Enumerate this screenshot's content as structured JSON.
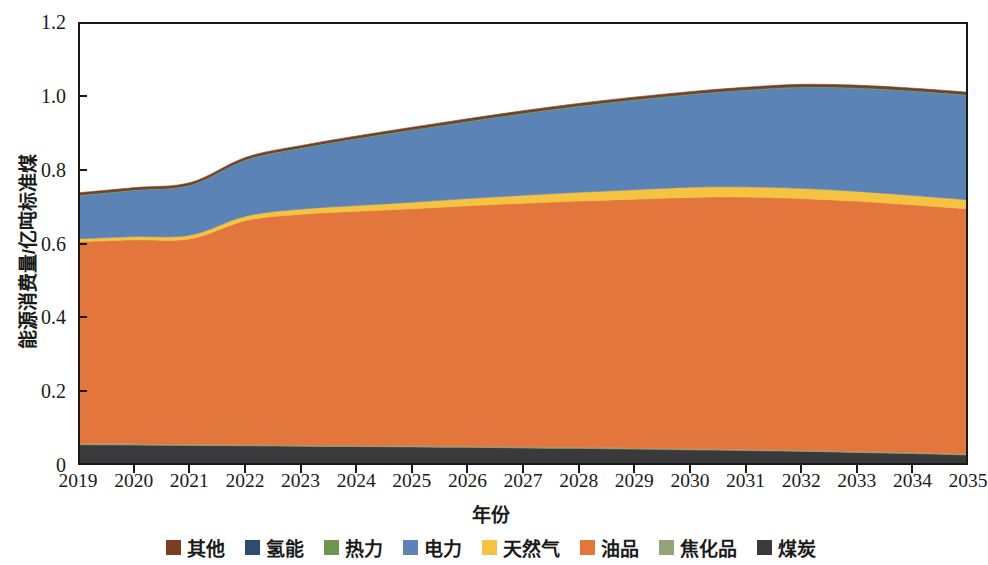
{
  "chart_data": {
    "type": "area",
    "stacked": true,
    "title": "",
    "xlabel": "年份",
    "ylabel": "能源消费量/亿吨标准煤",
    "xlim": [
      2019,
      2035
    ],
    "ylim": [
      0,
      1.2
    ],
    "ytick_labels": [
      "0",
      "0.2",
      "0.4",
      "0.6",
      "0.8",
      "1.0",
      "1.2"
    ],
    "ytick_values": [
      0,
      0.2,
      0.4,
      0.6,
      0.8,
      1.0,
      1.2
    ],
    "grid": false,
    "legend_position": "bottom",
    "categories": [
      2019,
      2020,
      2021,
      2022,
      2023,
      2024,
      2025,
      2026,
      2027,
      2028,
      2029,
      2030,
      2031,
      2032,
      2033,
      2034,
      2035
    ],
    "x": [
      "2019",
      "2020",
      "2021",
      "2022",
      "2023",
      "2024",
      "2025",
      "2026",
      "2027",
      "2028",
      "2029",
      "2030",
      "2031",
      "2032",
      "2033",
      "2034",
      "2035"
    ],
    "stack_order_bottom_to_top": [
      "煤炭",
      "焦化品",
      "油品",
      "天然气",
      "电力",
      "热力",
      "氢能",
      "其他"
    ],
    "series": [
      {
        "name": "煤炭",
        "color": "#3a3a3c",
        "values": [
          0.05,
          0.049,
          0.048,
          0.047,
          0.046,
          0.045,
          0.044,
          0.043,
          0.041,
          0.04,
          0.038,
          0.036,
          0.034,
          0.032,
          0.029,
          0.026,
          0.022
        ]
      },
      {
        "name": "焦化品",
        "color": "#93a37a",
        "values": [
          0.003,
          0.003,
          0.003,
          0.003,
          0.003,
          0.003,
          0.003,
          0.003,
          0.003,
          0.003,
          0.003,
          0.003,
          0.003,
          0.003,
          0.003,
          0.003,
          0.003
        ]
      },
      {
        "name": "油品",
        "color": "#e2763c",
        "values": [
          0.552,
          0.558,
          0.562,
          0.613,
          0.631,
          0.64,
          0.648,
          0.657,
          0.666,
          0.673,
          0.68,
          0.687,
          0.69,
          0.688,
          0.684,
          0.677,
          0.67
        ]
      },
      {
        "name": "天然气",
        "color": "#f5c242",
        "values": [
          0.008,
          0.009,
          0.01,
          0.012,
          0.014,
          0.016,
          0.018,
          0.02,
          0.022,
          0.024,
          0.026,
          0.028,
          0.028,
          0.028,
          0.027,
          0.026,
          0.025
        ]
      },
      {
        "name": "电力",
        "color": "#5b83b5",
        "values": [
          0.118,
          0.126,
          0.136,
          0.153,
          0.166,
          0.182,
          0.196,
          0.209,
          0.222,
          0.234,
          0.244,
          0.252,
          0.263,
          0.275,
          0.281,
          0.284,
          0.285
        ]
      },
      {
        "name": "热力",
        "color": "#6e9550",
        "values": [
          0.003,
          0.003,
          0.003,
          0.003,
          0.003,
          0.003,
          0.003,
          0.003,
          0.003,
          0.003,
          0.003,
          0.003,
          0.003,
          0.003,
          0.003,
          0.003,
          0.003
        ]
      },
      {
        "name": "氢能",
        "color": "#2e4b72",
        "values": [
          0.0,
          0.0,
          0.0,
          0.0,
          0.0,
          0.0,
          0.001,
          0.001,
          0.001,
          0.001,
          0.001,
          0.001,
          0.001,
          0.001,
          0.001,
          0.001,
          0.001
        ]
      },
      {
        "name": "其他",
        "color": "#7d3d22",
        "values": [
          0.005,
          0.005,
          0.005,
          0.005,
          0.005,
          0.005,
          0.005,
          0.005,
          0.005,
          0.005,
          0.005,
          0.005,
          0.005,
          0.005,
          0.005,
          0.005,
          0.005
        ]
      }
    ],
    "totals": [
      0.739,
      0.753,
      0.767,
      0.836,
      0.868,
      0.894,
      0.918,
      0.941,
      0.963,
      0.983,
      1.0,
      1.015,
      1.027,
      1.035,
      1.033,
      1.025,
      1.014
    ],
    "legend": [
      {
        "label": "其他",
        "color": "#7d3d22"
      },
      {
        "label": "氢能",
        "color": "#2e4b72"
      },
      {
        "label": "热力",
        "color": "#6e9550"
      },
      {
        "label": "电力",
        "color": "#5b83b5"
      },
      {
        "label": "天然气",
        "color": "#f5c242"
      },
      {
        "label": "油品",
        "color": "#e2763c"
      },
      {
        "label": "焦化品",
        "color": "#93a37a"
      },
      {
        "label": "煤炭",
        "color": "#3a3a3c"
      }
    ]
  }
}
